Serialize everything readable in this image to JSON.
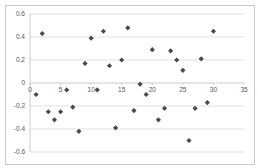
{
  "chart_data": {
    "type": "scatter",
    "title": "",
    "xlabel": "",
    "ylabel": "",
    "xlim": [
      0,
      35
    ],
    "ylim": [
      -0.6,
      0.6
    ],
    "xticks": [
      0,
      5,
      10,
      15,
      20,
      25,
      30,
      35
    ],
    "yticks": [
      -0.6,
      -0.4,
      -0.2,
      0,
      0.2,
      0.4,
      0.6
    ],
    "xtick_labels": [
      "0",
      "5",
      "10",
      "15",
      "20",
      "25",
      "30",
      "35"
    ],
    "ytick_labels": [
      "-0.6",
      "-0.4",
      "-0.2",
      "0",
      "0.2",
      "0.4",
      "0.6"
    ],
    "grid": {
      "horizontal": true,
      "vertical": false
    },
    "legend": null,
    "marker": "diamond",
    "marker_color": "#4a4a4a",
    "series": [
      {
        "name": "Series1",
        "x": [
          1,
          2,
          3,
          4,
          5,
          6,
          7,
          8,
          9,
          10,
          11,
          12,
          13,
          14,
          15,
          16,
          17,
          18,
          19,
          20,
          21,
          22,
          23,
          24,
          25,
          26,
          27,
          28,
          29,
          30
        ],
        "y": [
          -0.1,
          0.43,
          -0.25,
          -0.32,
          -0.25,
          -0.06,
          -0.21,
          -0.42,
          0.17,
          0.39,
          -0.06,
          0.45,
          0.15,
          -0.39,
          0.2,
          0.48,
          -0.24,
          -0.01,
          -0.1,
          0.29,
          -0.32,
          -0.22,
          0.28,
          0.2,
          0.11,
          -0.5,
          -0.22,
          0.21,
          -0.17,
          0.45
        ]
      }
    ]
  }
}
